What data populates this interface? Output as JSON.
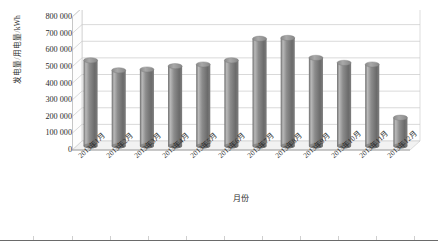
{
  "chart_data": {
    "type": "bar",
    "title": "",
    "subtitle": "",
    "xlabel": "月份",
    "ylabel": "发电量/用电量/kWh",
    "categories": [
      "2013年1月",
      "2013年2月",
      "2013年3月",
      "2013年4月",
      "2013年5月",
      "2013年6月",
      "2013年7月",
      "2013年8月",
      "2013年9月",
      "2013年10月",
      "2013年11月",
      "2013年12月"
    ],
    "values": [
      515000,
      455000,
      460000,
      480000,
      490000,
      515000,
      645000,
      650000,
      530000,
      500000,
      490000,
      170000
    ],
    "ylim": [
      0,
      800000
    ],
    "ytick_values": [
      0,
      100000,
      200000,
      300000,
      400000,
      500000,
      600000,
      700000,
      800000
    ],
    "ytick_labels": [
      "0",
      "100 000",
      "200 000",
      "300 000",
      "400 000",
      "500 000",
      "600 000",
      "700 000",
      "800 000"
    ],
    "grid": true,
    "legend": "none",
    "style": "3d-cylinder",
    "series": [
      {
        "name": "发电量/用电量",
        "color": "#8c8c8c"
      }
    ]
  },
  "colors": {
    "bar_fill": "#8c8c8c",
    "bar_highlight": "#b9b9b9",
    "bar_shadow": "#6b6b6b",
    "bar_top": "#9d9d9d",
    "grid": "#c8c8c8",
    "axis": "#9a9a9a",
    "wall": "#ffffff",
    "floor": "#f2f2f2",
    "text": "#2b2b2b",
    "rule": "#6a6a6a"
  }
}
